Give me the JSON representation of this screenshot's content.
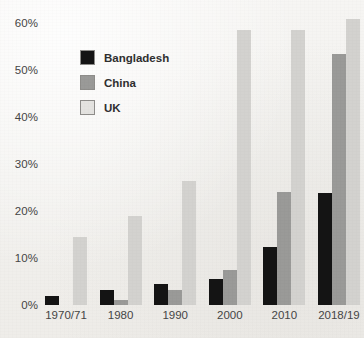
{
  "chart_data": {
    "type": "bar",
    "title": "",
    "xlabel": "",
    "ylabel": "",
    "ylim": [
      0,
      62
    ],
    "yticks": [
      0,
      10,
      20,
      30,
      40,
      50,
      60
    ],
    "ytick_labels": [
      "0%",
      "10%",
      "20%",
      "30%",
      "40%",
      "50%",
      "60%"
    ],
    "grid": false,
    "legend_position": "upper-left",
    "categories": [
      "1970/71",
      "1980",
      "1990",
      "2000",
      "2010",
      "2018/19"
    ],
    "series": [
      {
        "name": "Bangladesh",
        "color": "#141414",
        "values": [
          2.0,
          3.3,
          4.5,
          5.5,
          12.3,
          23.8
        ]
      },
      {
        "name": "China",
        "color": "#9a9a98",
        "values": [
          0.0,
          1.0,
          3.3,
          7.5,
          24.0,
          53.5
        ]
      },
      {
        "name": "UK",
        "color": "#d3d2cf",
        "values": [
          14.5,
          19.0,
          26.5,
          58.5,
          58.5,
          61.0
        ]
      }
    ]
  }
}
